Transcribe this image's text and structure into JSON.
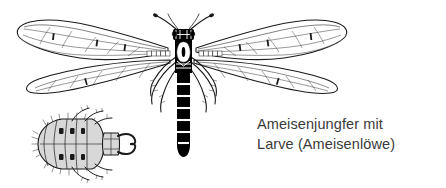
{
  "figure": {
    "background_color": "#ffffff",
    "ink_color": "#1a1a1a",
    "body_fill_color": "#000000",
    "larva_fill_color": "#d8d8d8",
    "caption_color": "#3a3a3a"
  },
  "caption": {
    "line1": "Ameisenjungfer mit",
    "line2": "Larve (Ameisenlöwe)"
  },
  "labels": {
    "adult": "Ameisenjungfer",
    "larva": "Ameisenlöwe"
  }
}
